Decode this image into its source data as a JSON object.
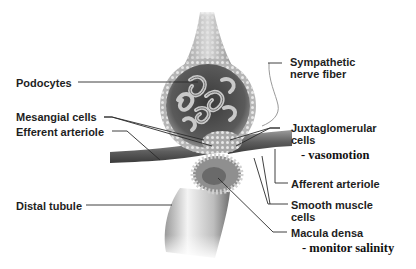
{
  "diagram": {
    "labels_left": [
      {
        "id": "podocytes",
        "text": "Podocytes"
      },
      {
        "id": "mesangial",
        "text": "Mesangial cells"
      },
      {
        "id": "efferent",
        "text": "Efferent arteriole"
      },
      {
        "id": "distal",
        "text": "Distal tubule"
      }
    ],
    "labels_right": [
      {
        "id": "sympathetic",
        "line1": "Sympathetic",
        "line2": "nerve fiber"
      },
      {
        "id": "juxtaglomerular",
        "line1": "Juxtaglomerular",
        "line2": "cells",
        "note": "- vasomotion"
      },
      {
        "id": "afferent",
        "line1": "Afferent arteriole"
      },
      {
        "id": "smooth_muscle",
        "line1": "Smooth muscle",
        "line2": "cells"
      },
      {
        "id": "macula_densa",
        "line1": "Macula densa",
        "note": "- monitor salinity"
      }
    ]
  }
}
